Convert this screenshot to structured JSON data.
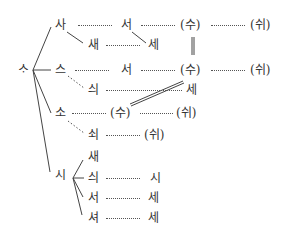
{
  "diagram": {
    "type": "derivation-tree",
    "root": {
      "label": "ᄉᆞ"
    },
    "nodes": [
      {
        "id": "sa",
        "label": "사"
      },
      {
        "id": "sa_seo",
        "label": "서"
      },
      {
        "id": "sa_su",
        "label": "(수)"
      },
      {
        "id": "sa_swi",
        "label": "(쉬)"
      },
      {
        "id": "sae1",
        "label": "새"
      },
      {
        "id": "sae1_se",
        "label": "세"
      },
      {
        "id": "seu",
        "label": "스"
      },
      {
        "id": "seu_seo",
        "label": "서"
      },
      {
        "id": "seu_su",
        "label": "(수)"
      },
      {
        "id": "seu_swi",
        "label": "(쉬)"
      },
      {
        "id": "seui1",
        "label": "싀"
      },
      {
        "id": "seui1_se",
        "label": "세"
      },
      {
        "id": "so",
        "label": "소"
      },
      {
        "id": "so_su",
        "label": "(수)"
      },
      {
        "id": "so_swi",
        "label": "(쉬)"
      },
      {
        "id": "soe",
        "label": "쇠"
      },
      {
        "id": "soe_swi",
        "label": "(쉬)"
      },
      {
        "id": "si",
        "label": "시"
      },
      {
        "id": "si_sae",
        "label": "새"
      },
      {
        "id": "si_seui",
        "label": "싀"
      },
      {
        "id": "si_seui_si",
        "label": "시"
      },
      {
        "id": "si_seo",
        "label": "서"
      },
      {
        "id": "si_seo_se",
        "label": "세"
      },
      {
        "id": "si_syeo",
        "label": "셔"
      },
      {
        "id": "si_syeo_se",
        "label": "세"
      }
    ],
    "edges_note": "solid = branch, dotted = change, double = equivalence"
  }
}
